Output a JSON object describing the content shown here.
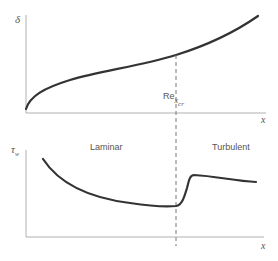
{
  "diagram": {
    "colors": {
      "axis": "#9a9a9a",
      "curve": "#333333",
      "text": "#555555"
    },
    "top_panel": {
      "y_label": "δ",
      "x_label": "x",
      "transition_label_main": "Re",
      "transition_label_sub": "x",
      "transition_label_subsub": "cr"
    },
    "bottom_panel": {
      "y_label_main": "τ",
      "y_label_sub": "w",
      "x_label": "x",
      "region_left": "Laminar",
      "region_right": "Turbulent"
    }
  }
}
